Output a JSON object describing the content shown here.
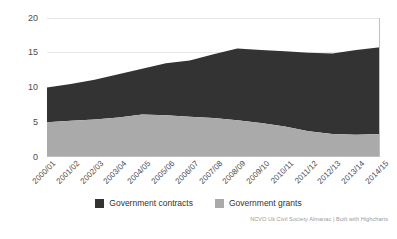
{
  "chart_data": {
    "type": "area",
    "stacked": true,
    "title": "",
    "subtitle": "",
    "xlabel": "",
    "ylabel": "",
    "ylim": [
      0,
      20
    ],
    "yticks": [
      0,
      5,
      10,
      15,
      20
    ],
    "ytick_labels": [
      "0",
      "5",
      "10",
      "15",
      "20"
    ],
    "grid": true,
    "legend_position": "bottom-center",
    "categories": [
      "2000/01",
      "2001/02",
      "2002/03",
      "2003/04",
      "2004/05",
      "2005/06",
      "2006/07",
      "2007/08",
      "2008/09",
      "2009/10",
      "2010/11",
      "2011/12",
      "2012/13",
      "2013/14",
      "2014/15"
    ],
    "series": [
      {
        "name": "Government grants",
        "color": "#aaaaaa",
        "values": [
          5.0,
          5.2,
          5.4,
          5.7,
          6.1,
          6.0,
          5.8,
          5.6,
          5.3,
          4.9,
          4.4,
          3.7,
          3.3,
          3.2,
          3.3
        ]
      },
      {
        "name": "Government contracts",
        "color": "#333333",
        "values": [
          5.0,
          5.3,
          5.7,
          6.2,
          6.6,
          7.5,
          8.1,
          9.2,
          10.3,
          10.5,
          10.8,
          11.3,
          11.6,
          12.2,
          12.5
        ]
      }
    ],
    "totals": [
      10.0,
      10.5,
      11.1,
      11.9,
      12.7,
      13.5,
      13.9,
      14.8,
      15.6,
      15.4,
      15.2,
      15.0,
      14.9,
      15.4,
      15.8
    ],
    "credit": "NCVO Uk Civil Society Almanac | Built with Highcharts"
  },
  "legend": {
    "items": [
      {
        "label": "Government contracts",
        "color": "#333333"
      },
      {
        "label": "Government grants",
        "color": "#aaaaaa"
      }
    ]
  }
}
